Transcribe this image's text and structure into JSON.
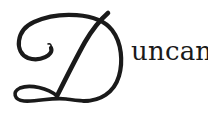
{
  "logo": {
    "initial": "D",
    "text": "uncan",
    "full_name": "Duncan",
    "ink_color": "#1a1a1a",
    "background": "#ffffff"
  }
}
